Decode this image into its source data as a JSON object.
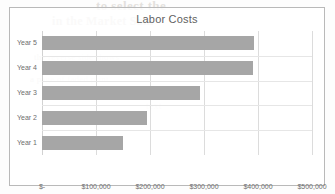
{
  "chart_data": {
    "type": "bar",
    "orientation": "horizontal",
    "title": "Labor Costs",
    "xlabel": "",
    "ylabel": "",
    "categories": [
      "Year 1",
      "Year 2",
      "Year 3",
      "Year 4",
      "Year 5"
    ],
    "values": [
      150000,
      195000,
      292000,
      390000,
      392000
    ],
    "xlim": [
      0,
      500000
    ],
    "xticks": [
      0,
      100000,
      200000,
      300000,
      400000,
      500000
    ],
    "xtick_labels": [
      "$-",
      "$100,000",
      "$200,000",
      "$300,000",
      "$400,000",
      "$500,000"
    ],
    "grid": true,
    "legend": false,
    "bar_color": "#a6a6a6",
    "gridline_color": "#dcdcdc",
    "title_color": "#5f5f5f",
    "tick_label_color": "#6e6e6e"
  },
  "background_text": {
    "line1": "to select the",
    "line2": "in the Market Sam",
    "line3": "the reverse side shows",
    "line4": "a page of faded print",
    "line5": "text",
    "line6": "show-through from behind"
  }
}
